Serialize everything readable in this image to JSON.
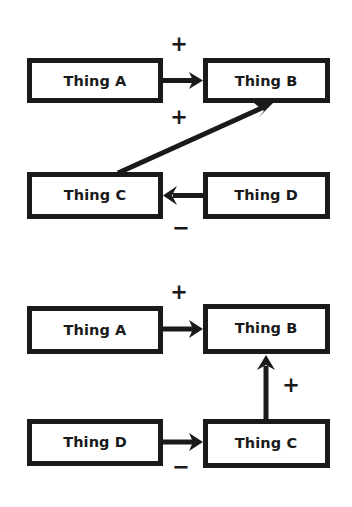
{
  "page": {
    "background_color": "#ffffff",
    "ink_color": "#1a1a1a",
    "width": 352,
    "height": 507
  },
  "diagrams": [
    {
      "id": "top-diagram",
      "name": "causal-diagram-top",
      "nodes": [
        {
          "id": "a",
          "label": "Thing A",
          "x": 27,
          "y": 58,
          "w": 136,
          "h": 45
        },
        {
          "id": "b",
          "label": "Thing B",
          "x": 203,
          "y": 58,
          "w": 127,
          "h": 45
        },
        {
          "id": "c",
          "label": "Thing C",
          "x": 27,
          "y": 172,
          "w": 136,
          "h": 47
        },
        {
          "id": "d",
          "label": "Thing D",
          "x": 203,
          "y": 172,
          "w": 127,
          "h": 47
        }
      ],
      "edges": [
        {
          "id": "a-to-b",
          "from": "Thing A",
          "to": "Thing B",
          "sign": "+",
          "sign_x": 179,
          "sign_y": 45
        },
        {
          "id": "c-to-b",
          "from": "Thing C",
          "to": "Thing B",
          "sign": "+",
          "sign_x": 179,
          "sign_y": 118
        },
        {
          "id": "d-to-c",
          "from": "Thing D",
          "to": "Thing C",
          "sign": "−",
          "sign_x": 181,
          "sign_y": 229
        }
      ]
    },
    {
      "id": "bottom-diagram",
      "name": "causal-diagram-bottom",
      "nodes": [
        {
          "id": "a",
          "label": "Thing A",
          "x": 27,
          "y": 306,
          "w": 136,
          "h": 48
        },
        {
          "id": "b",
          "label": "Thing B",
          "x": 203,
          "y": 304,
          "w": 127,
          "h": 50
        },
        {
          "id": "d",
          "label": "Thing D",
          "x": 27,
          "y": 419,
          "w": 136,
          "h": 47
        },
        {
          "id": "c",
          "label": "Thing C",
          "x": 203,
          "y": 419,
          "w": 127,
          "h": 49
        }
      ],
      "edges": [
        {
          "id": "a-to-b",
          "from": "Thing A",
          "to": "Thing B",
          "sign": "+",
          "sign_x": 179,
          "sign_y": 293
        },
        {
          "id": "c-to-b",
          "from": "Thing C",
          "to": "Thing B",
          "sign": "+",
          "sign_x": 291,
          "sign_y": 386
        },
        {
          "id": "d-to-c",
          "from": "Thing D",
          "to": "Thing C",
          "sign": "−",
          "sign_x": 181,
          "sign_y": 468
        }
      ]
    }
  ]
}
